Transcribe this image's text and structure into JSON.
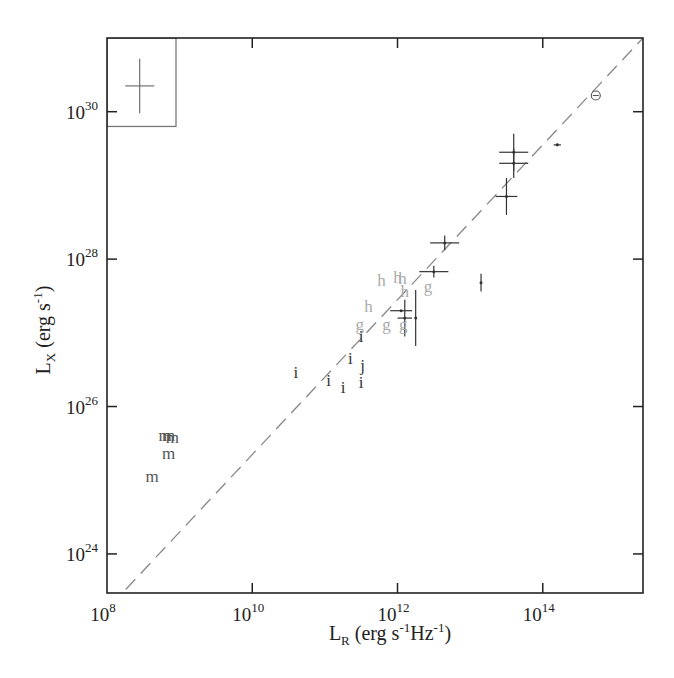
{
  "chart_data": {
    "type": "scatter",
    "title": "",
    "xlabel": "L_R (erg s^-1 Hz^-1)",
    "ylabel": "L_X (erg s^-1)",
    "xscale": "log",
    "yscale": "log",
    "xlim_log10": [
      8.0,
      15.38
    ],
    "ylim_log10": [
      23.47,
      31.0
    ],
    "x_ticks": [
      {
        "base": "10",
        "exp": "8",
        "value": 8
      },
      {
        "base": "10",
        "exp": "10",
        "value": 10
      },
      {
        "base": "10",
        "exp": "12",
        "value": 12
      },
      {
        "base": "10",
        "exp": "14",
        "value": 14
      }
    ],
    "y_ticks": [
      {
        "base": "10",
        "exp": "24",
        "value": 24
      },
      {
        "base": "10",
        "exp": "26",
        "value": 26
      },
      {
        "base": "10",
        "exp": "28",
        "value": 28
      },
      {
        "base": "10",
        "exp": "30",
        "value": 30
      }
    ],
    "grid": false,
    "legend": null,
    "reference_line": {
      "style": "dashed",
      "color": "#888888",
      "from_log10": [
        8.05,
        23.3
      ],
      "to_log10": [
        15.38,
        31.0
      ]
    },
    "inset_box": {
      "description": "typical error bar",
      "x_log10": [
        8.0,
        8.95
      ],
      "y_log10": [
        29.8,
        31.0
      ],
      "cross_center_log10": [
        8.45,
        30.35
      ],
      "cross_half_width_dex": 0.2,
      "cross_half_height_dex": 0.37
    },
    "sun_symbol": {
      "label": "⊙",
      "x_log10": 14.73,
      "y_log10": 30.22
    },
    "error_bar_points": [
      {
        "x": 13.6,
        "y": 29.45,
        "xerr": 0.2,
        "yerr": 0.25
      },
      {
        "x": 13.6,
        "y": 29.3,
        "xerr": 0.2,
        "yerr": 0.2
      },
      {
        "x": 13.5,
        "y": 28.85,
        "xerr": 0.15,
        "yerr": 0.25
      },
      {
        "x": 14.2,
        "y": 29.55,
        "xerr": 0.05,
        "yerr": 0.02
      },
      {
        "x": 12.65,
        "y": 28.22,
        "xerr": 0.2,
        "yerr": 0.1
      },
      {
        "x": 12.5,
        "y": 27.83,
        "xerr": 0.2,
        "yerr": 0.08
      },
      {
        "x": 13.15,
        "y": 27.68,
        "xerr": 0.0,
        "yerr": 0.12
      },
      {
        "x": 12.05,
        "y": 27.3,
        "xerr": 0.15,
        "yerr": 0.0
      },
      {
        "x": 12.1,
        "y": 27.2,
        "xerr": 0.1,
        "yerr": 0.25
      },
      {
        "x": 12.25,
        "y": 27.2,
        "xerr": 0.0,
        "yerr": 0.38
      }
    ],
    "letter_points": [
      {
        "label": "h",
        "x": 11.78,
        "y": 27.7,
        "shade": "light"
      },
      {
        "label": "h",
        "x": 12.0,
        "y": 27.75,
        "shade": "light"
      },
      {
        "label": "h",
        "x": 12.07,
        "y": 27.73,
        "shade": "light"
      },
      {
        "label": "h",
        "x": 12.1,
        "y": 27.55,
        "shade": "light"
      },
      {
        "label": "g",
        "x": 12.42,
        "y": 27.62,
        "shade": "light"
      },
      {
        "label": "h",
        "x": 11.6,
        "y": 27.35,
        "shade": "light"
      },
      {
        "label": "g",
        "x": 11.48,
        "y": 27.1,
        "shade": "light"
      },
      {
        "label": "g",
        "x": 11.85,
        "y": 27.1,
        "shade": "light"
      },
      {
        "label": "g",
        "x": 12.08,
        "y": 27.1,
        "shade": "light"
      },
      {
        "label": "i",
        "x": 11.5,
        "y": 26.95,
        "shade": "dark"
      },
      {
        "label": "i",
        "x": 11.35,
        "y": 26.65,
        "shade": "dark"
      },
      {
        "label": "j",
        "x": 11.52,
        "y": 26.55,
        "shade": "dark"
      },
      {
        "label": "i",
        "x": 11.5,
        "y": 26.32,
        "shade": "dark"
      },
      {
        "label": "i",
        "x": 11.05,
        "y": 26.35,
        "shade": "dark"
      },
      {
        "label": "i",
        "x": 11.25,
        "y": 26.25,
        "shade": "dark"
      },
      {
        "label": "i",
        "x": 10.6,
        "y": 26.45,
        "shade": "dark"
      },
      {
        "label": "m",
        "x": 8.8,
        "y": 25.6,
        "shade": "mid"
      },
      {
        "label": "m",
        "x": 8.85,
        "y": 25.6,
        "shade": "mid"
      },
      {
        "label": "m",
        "x": 8.9,
        "y": 25.57,
        "shade": "mid"
      },
      {
        "label": "m",
        "x": 8.85,
        "y": 25.35,
        "shade": "mid"
      },
      {
        "label": "m",
        "x": 8.62,
        "y": 25.05,
        "shade": "mid"
      }
    ],
    "colors": {
      "axes": "#222222",
      "dashed_line": "#888888",
      "dark": "#333333",
      "mid": "#555555",
      "light": "#aaaaaa",
      "inset_box": "#777777"
    }
  }
}
